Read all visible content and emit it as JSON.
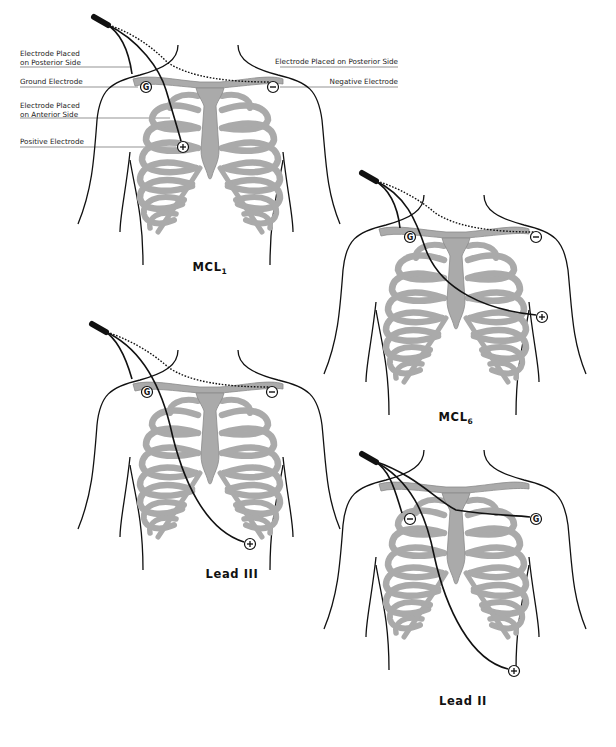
{
  "colors": {
    "outline": "#111111",
    "bone_fill": "#aaaaaa",
    "bone_stroke": "#8a8a8a",
    "cable": "#111111",
    "leader_line": "#666666",
    "background": "#ffffff"
  },
  "labels": [
    {
      "id": "posterior-left",
      "lines": [
        "Electrode Placed",
        "on Posterior Side"
      ],
      "x": 20,
      "y": 56,
      "line_y": 67,
      "line_x2": 130
    },
    {
      "id": "ground",
      "lines": [
        "Ground Electrode"
      ],
      "x": 20,
      "y": 84,
      "line_y": 87,
      "line_x2": 138
    },
    {
      "id": "anterior",
      "lines": [
        "Electrode Placed",
        "on Anterior Side"
      ],
      "x": 20,
      "y": 108,
      "line_y": 118,
      "line_x2": 170
    },
    {
      "id": "positive",
      "lines": [
        "Positive Electrode"
      ],
      "x": 20,
      "y": 144,
      "line_y": 147,
      "line_x2": 176
    },
    {
      "id": "posterior-right",
      "lines": [
        "Electrode Placed on Posterior Side"
      ],
      "x": 398,
      "y": 64,
      "line_y": 67,
      "line_x2": 280,
      "anchor": "end"
    },
    {
      "id": "negative",
      "lines": [
        "Negative Electrode"
      ],
      "x": 398,
      "y": 84,
      "line_y": 87,
      "line_x2": 280,
      "anchor": "end"
    }
  ],
  "figures": [
    {
      "id": "mcl1",
      "caption": "MCL",
      "caption_sub": "1",
      "dx": 0,
      "dy": 0,
      "caption_x": 210,
      "caption_y": 271,
      "electrodes": [
        {
          "type": "ground",
          "symbol": "G",
          "x": 146,
          "y": 87
        },
        {
          "type": "negative",
          "symbol": "−",
          "x": 273,
          "y": 87
        },
        {
          "type": "positive",
          "symbol": "+",
          "x": 183,
          "y": 147
        }
      ],
      "cables": [
        {
          "d": "M106,24 C125,35 130,60 132,74",
          "dashed": false
        },
        {
          "d": "M106,24 C140,40 160,70 166,90 C172,110 178,130 181,141",
          "dashed": false
        },
        {
          "d": "M106,24 C140,35 160,55 167,62 C190,78 230,82 270,82",
          "dashed": true
        }
      ]
    },
    {
      "id": "mcl6",
      "caption": "MCL",
      "caption_sub": "6",
      "dx": 246,
      "dy": 150,
      "caption_x": 210,
      "caption_y": 271,
      "electrodes": [
        {
          "type": "ground",
          "symbol": "G",
          "x": 164,
          "y": 87
        },
        {
          "type": "negative",
          "symbol": "−",
          "x": 290,
          "y": 87
        },
        {
          "type": "positive",
          "symbol": "+",
          "x": 296,
          "y": 167
        }
      ],
      "cables": [
        {
          "d": "M128,30 C145,40 152,60 154,78",
          "dashed": false
        },
        {
          "d": "M128,30 C160,45 170,70 180,100 C195,140 240,160 290,165",
          "dashed": false
        },
        {
          "d": "M128,30 C160,40 180,55 188,62 C210,78 250,82 288,82",
          "dashed": true
        }
      ]
    },
    {
      "id": "lead-iii",
      "caption": "Lead III",
      "caption_sub": "",
      "dx": 0,
      "dy": 305,
      "caption_x": 232,
      "caption_y": 273,
      "electrodes": [
        {
          "type": "ground",
          "symbol": "G",
          "x": 147,
          "y": 87
        },
        {
          "type": "negative",
          "symbol": "−",
          "x": 272,
          "y": 87
        },
        {
          "type": "positive",
          "symbol": "+",
          "x": 250,
          "y": 239
        }
      ],
      "cables": [
        {
          "d": "M104,26 C120,35 128,60 132,74",
          "dashed": false
        },
        {
          "d": "M104,26 C140,42 160,80 170,120 C182,175 205,225 244,237",
          "dashed": false
        },
        {
          "d": "M104,26 C140,38 160,55 168,62 C190,78 230,82 270,82",
          "dashed": true
        }
      ]
    },
    {
      "id": "lead-ii",
      "caption": "Lead II",
      "caption_sub": "",
      "dx": 246,
      "dy": 405,
      "caption_x": 217,
      "caption_y": 300,
      "electrodes": [
        {
          "type": "negative",
          "symbol": "−",
          "x": 164,
          "y": 114
        },
        {
          "type": "ground",
          "symbol": "G",
          "x": 290,
          "y": 114
        },
        {
          "type": "positive",
          "symbol": "+",
          "x": 268,
          "y": 266
        }
      ],
      "cables": [
        {
          "d": "M128,56 C145,65 150,90 156,108",
          "dashed": false
        },
        {
          "d": "M128,56 C165,75 180,110 188,150 C200,205 225,255 262,264",
          "dashed": false
        },
        {
          "d": "M128,56 C170,70 190,95 210,105 C240,110 265,110 284,112",
          "dashed": false
        }
      ]
    }
  ]
}
